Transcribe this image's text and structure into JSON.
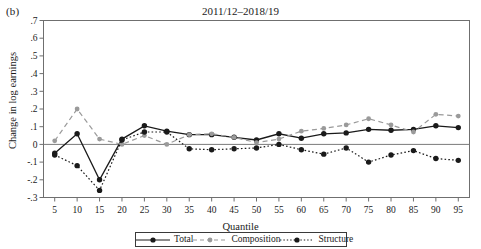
{
  "panel_label": "(b)",
  "figure": {
    "title": "2011/12–2018/19",
    "ylabel": "Change in log earnings",
    "xlabel": "Quantile"
  },
  "legend": {
    "position": "bottom-center",
    "items": [
      {
        "name": "total-legend",
        "label": "Total",
        "marker": "solid-circle",
        "line": "solid",
        "color": "#1a1a1a"
      },
      {
        "name": "composition-legend",
        "label": "Composition",
        "marker": "solid-circle",
        "line": "dashed",
        "color": "#9a9a9a"
      },
      {
        "name": "structure-legend",
        "label": "Structure",
        "marker": "solid-circle",
        "line": "dotted",
        "color": "#1a1a1a"
      }
    ]
  },
  "chart_data": {
    "type": "line",
    "title": "2011/12–2018/19",
    "xlabel": "Quantile",
    "ylabel": "Change in log earnings",
    "grid": false,
    "zero_line": true,
    "xlim": [
      2.5,
      97.5
    ],
    "ylim": [
      -0.3,
      0.7
    ],
    "xticks": [
      5,
      10,
      15,
      20,
      25,
      30,
      35,
      40,
      45,
      50,
      55,
      60,
      65,
      70,
      75,
      80,
      85,
      90,
      95
    ],
    "yticks": [
      -0.3,
      -0.2,
      -0.1,
      0,
      0.1,
      0.2,
      0.3,
      0.4,
      0.5,
      0.6,
      0.7
    ],
    "ytick_labels": [
      "-.3",
      "-.2",
      "-.1",
      "0",
      ".1",
      ".2",
      ".3",
      ".4",
      ".5",
      ".6",
      ".7"
    ],
    "x": [
      5,
      10,
      15,
      20,
      25,
      30,
      35,
      40,
      45,
      50,
      55,
      60,
      65,
      70,
      75,
      80,
      85,
      90,
      95
    ],
    "series": [
      {
        "name": "Total",
        "color": "#1a1a1a",
        "line": "solid",
        "values": [
          -0.05,
          0.06,
          -0.2,
          0.03,
          0.105,
          0.075,
          0.055,
          0.055,
          0.04,
          0.025,
          0.06,
          0.035,
          0.06,
          0.065,
          0.085,
          0.08,
          0.085,
          0.105,
          0.095
        ]
      },
      {
        "name": "Composition",
        "color": "#9a9a9a",
        "line": "dashed",
        "values": [
          0.02,
          0.2,
          0.03,
          0.0,
          0.05,
          0.0,
          0.055,
          0.06,
          0.04,
          0.01,
          0.03,
          0.075,
          0.09,
          0.11,
          0.145,
          0.11,
          0.07,
          0.17,
          0.16
        ]
      },
      {
        "name": "Structure",
        "color": "#1a1a1a",
        "line": "dotted",
        "values": [
          -0.06,
          -0.12,
          -0.26,
          0.025,
          0.07,
          0.07,
          -0.025,
          -0.03,
          -0.025,
          -0.02,
          0.0,
          -0.03,
          -0.055,
          -0.02,
          -0.1,
          -0.06,
          -0.035,
          -0.08,
          -0.09
        ]
      }
    ]
  }
}
